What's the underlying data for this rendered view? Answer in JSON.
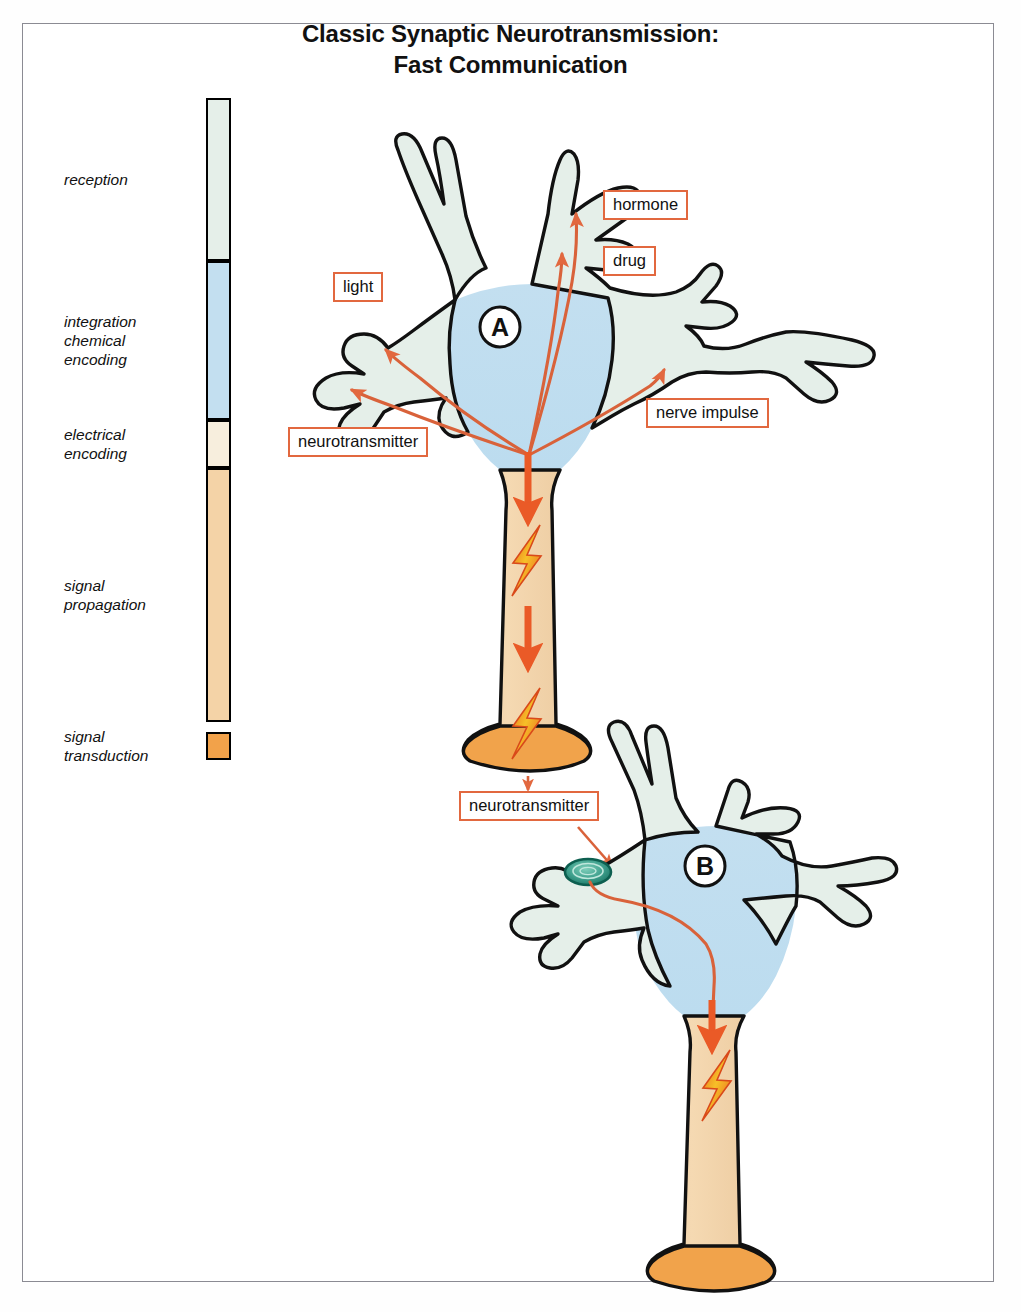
{
  "title": {
    "line1": "Classic Synaptic Neurotransmission:",
    "line2": "Fast Communication"
  },
  "colors": {
    "reception": "#e4efe8",
    "integration": "#c2dff0",
    "electrical": "#f6ecdc",
    "propagation": "#f3d2a6",
    "transduction": "#f0a košice"
  },
  "legend": {
    "name": "signal-stage-legend",
    "segments": [
      {
        "label": "reception",
        "color": "#e5efe9",
        "top": 0,
        "height": 163
      },
      {
        "label": "integration\nchemical\nencoding",
        "color": "#c3dff0",
        "top": 163,
        "height": 159
      },
      {
        "label": "electrical\nencoding",
        "color": "#f7eedd",
        "top": 322,
        "height": 48
      },
      {
        "label": "signal\npropagation",
        "color": "#f4d3a7",
        "top": 370,
        "height": 254
      },
      {
        "label": "signal\ntransduction",
        "color": "#f2a24a",
        "top": 634,
        "height": 28
      }
    ]
  },
  "neurons": [
    {
      "id": "A",
      "name": "neuron-a",
      "letter": "A"
    },
    {
      "id": "B",
      "name": "neuron-b",
      "letter": "B"
    }
  ],
  "callouts": [
    {
      "name": "callout-hormone",
      "text": "hormone",
      "x": 603,
      "y": 190
    },
    {
      "name": "callout-drug",
      "text": "drug",
      "x": 603,
      "y": 246
    },
    {
      "name": "callout-light",
      "text": "light",
      "x": 333,
      "y": 272
    },
    {
      "name": "callout-nerve-impulse",
      "text": "nerve impulse",
      "x": 646,
      "y": 398
    },
    {
      "name": "callout-neurotransmitter-a",
      "text": "neurotransmitter",
      "x": 288,
      "y": 427
    },
    {
      "name": "callout-neurotransmitter-b",
      "text": "neurotransmitter",
      "x": 459,
      "y": 791
    }
  ],
  "diagram": {
    "type": "biological-schematic",
    "stages": [
      "reception",
      "integration / chemical encoding",
      "electrical encoding",
      "signal propagation",
      "signal transduction"
    ],
    "inputs": [
      "hormone",
      "drug",
      "light",
      "nerve impulse",
      "neurotransmitter"
    ],
    "flow": "inputs converge on neuron A soma, encode to an action potential that propagates down the axon, releasing neurotransmitter into the synaptic cleft, which is received by neuron B and propagates down its axon"
  }
}
